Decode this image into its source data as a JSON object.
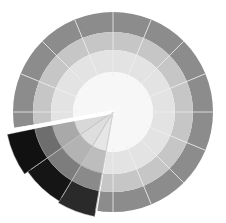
{
  "figure": {
    "title": "",
    "width": 226,
    "height": 223,
    "background": "#ffffff"
  },
  "wheel": {
    "center": [
      113,
      112
    ],
    "sector_count": 16,
    "ring_radii": [
      100,
      80,
      62,
      40
    ],
    "divider_color": "#eeeeee",
    "rings": [
      {
        "name": "outer-ring",
        "inner": 80,
        "outer": 100,
        "color": "#8c8c8c"
      },
      {
        "name": "second-ring",
        "inner": 62,
        "outer": 80,
        "color": "#c6c6c6"
      },
      {
        "name": "third-ring",
        "inner": 40,
        "outer": 62,
        "color": "#e3e3e3"
      },
      {
        "name": "center-disc",
        "inner": 0,
        "outer": 40,
        "color": "#f7f7f7"
      }
    ]
  },
  "highlight": {
    "start_deg": 100,
    "end_deg": 168,
    "gap_color": "#ffffff",
    "gap_width": 4,
    "wedges": [
      {
        "name": "wedge-a",
        "start_deg": 145,
        "end_deg": 168,
        "bands": [
          {
            "inner": 80,
            "outer": 108,
            "color": "#111111"
          },
          {
            "inner": 62,
            "outer": 80,
            "color": "#6e6e6e"
          },
          {
            "inner": 40,
            "outer": 62,
            "color": "#a9a9a9"
          },
          {
            "inner": 0,
            "outer": 40,
            "color": "#d8d8d8"
          }
        ]
      },
      {
        "name": "wedge-b",
        "start_deg": 121,
        "end_deg": 145,
        "bands": [
          {
            "inner": 80,
            "outer": 104,
            "color": "#151515"
          },
          {
            "inner": 62,
            "outer": 80,
            "color": "#7d7d7d"
          },
          {
            "inner": 40,
            "outer": 62,
            "color": "#b3b3b3"
          },
          {
            "inner": 0,
            "outer": 40,
            "color": "#dedede"
          }
        ]
      },
      {
        "name": "wedge-c",
        "start_deg": 100,
        "end_deg": 121,
        "bands": [
          {
            "inner": 80,
            "outer": 106,
            "color": "#2a2a2a"
          },
          {
            "inner": 62,
            "outer": 80,
            "color": "#8a8a8a"
          },
          {
            "inner": 40,
            "outer": 62,
            "color": "#bdbdbd"
          },
          {
            "inner": 0,
            "outer": 40,
            "color": "#e6e6e6"
          }
        ]
      }
    ]
  }
}
